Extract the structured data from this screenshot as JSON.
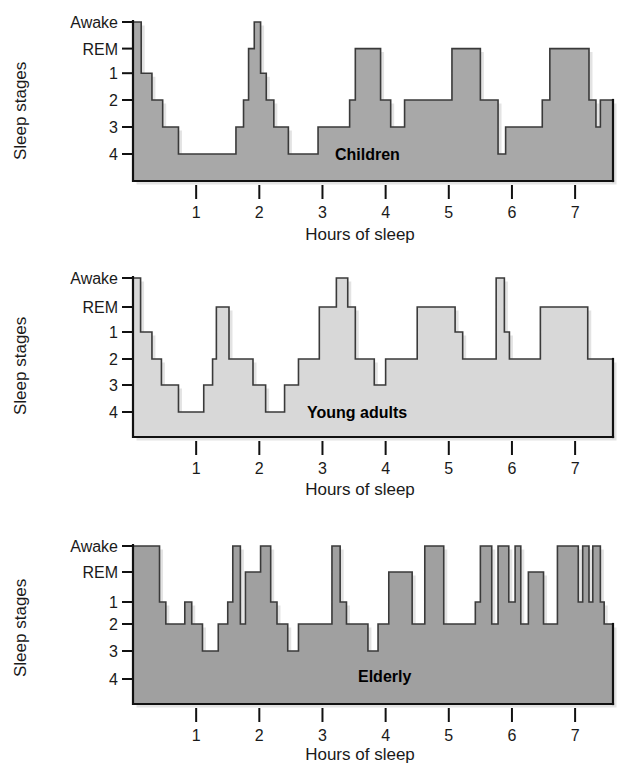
{
  "figure": {
    "title": "",
    "background_color": "#ffffff"
  },
  "axis_labels": {
    "y_title": "Sleep stages",
    "x_title": "Hours of sleep",
    "y_ticks": [
      "Awake",
      "REM",
      "1",
      "2",
      "3",
      "4"
    ],
    "x_ticks": [
      "1",
      "2",
      "3",
      "4",
      "5",
      "6",
      "7"
    ]
  },
  "panels": [
    {
      "label": "Children",
      "fill_color": "#a8a8a8",
      "stroke_color": "#3a3a3a"
    },
    {
      "label": "Young adults",
      "fill_color": "#d8d8d8",
      "stroke_color": "#555555"
    },
    {
      "label": "Elderly",
      "fill_color": "#a0a0a0",
      "stroke_color": "#2e2e2e"
    }
  ],
  "chart_data": [
    {
      "type": "area",
      "title": "Children",
      "xlabel": "Hours of sleep",
      "ylabel": "Sleep stages",
      "xlim": [
        0,
        7.6
      ],
      "ylim_categories": [
        "Awake",
        "REM",
        "1",
        "2",
        "3",
        "4"
      ],
      "y_numeric_map": {
        "Awake": 0,
        "REM": 1,
        "1": 2,
        "2": 3,
        "3": 4,
        "4": 5
      },
      "grid": false,
      "legend": "none",
      "fill_color": "#a8a8a8",
      "steps": [
        {
          "x_start": 0.0,
          "x_end": 0.13,
          "stage": "Awake"
        },
        {
          "x_start": 0.13,
          "x_end": 0.3,
          "stage": "1"
        },
        {
          "x_start": 0.3,
          "x_end": 0.47,
          "stage": "2"
        },
        {
          "x_start": 0.47,
          "x_end": 0.72,
          "stage": "3"
        },
        {
          "x_start": 0.72,
          "x_end": 1.63,
          "stage": "4"
        },
        {
          "x_start": 1.63,
          "x_end": 1.75,
          "stage": "3"
        },
        {
          "x_start": 1.75,
          "x_end": 1.83,
          "stage": "2"
        },
        {
          "x_start": 1.83,
          "x_end": 1.92,
          "stage": "REM"
        },
        {
          "x_start": 1.92,
          "x_end": 2.02,
          "stage": "Awake"
        },
        {
          "x_start": 2.02,
          "x_end": 2.11,
          "stage": "1"
        },
        {
          "x_start": 2.11,
          "x_end": 2.23,
          "stage": "2"
        },
        {
          "x_start": 2.23,
          "x_end": 2.46,
          "stage": "3"
        },
        {
          "x_start": 2.46,
          "x_end": 2.93,
          "stage": "4"
        },
        {
          "x_start": 2.93,
          "x_end": 3.43,
          "stage": "3"
        },
        {
          "x_start": 3.43,
          "x_end": 3.52,
          "stage": "2"
        },
        {
          "x_start": 3.52,
          "x_end": 3.92,
          "stage": "REM"
        },
        {
          "x_start": 3.92,
          "x_end": 4.08,
          "stage": "2"
        },
        {
          "x_start": 4.08,
          "x_end": 4.3,
          "stage": "3"
        },
        {
          "x_start": 4.3,
          "x_end": 5.05,
          "stage": "2"
        },
        {
          "x_start": 5.05,
          "x_end": 5.5,
          "stage": "REM"
        },
        {
          "x_start": 5.5,
          "x_end": 5.78,
          "stage": "2"
        },
        {
          "x_start": 5.78,
          "x_end": 5.9,
          "stage": "4"
        },
        {
          "x_start": 5.9,
          "x_end": 6.48,
          "stage": "3"
        },
        {
          "x_start": 6.48,
          "x_end": 6.6,
          "stage": "2"
        },
        {
          "x_start": 6.6,
          "x_end": 7.22,
          "stage": "REM"
        },
        {
          "x_start": 7.22,
          "x_end": 7.33,
          "stage": "2"
        },
        {
          "x_start": 7.33,
          "x_end": 7.4,
          "stage": "3"
        },
        {
          "x_start": 7.4,
          "x_end": 7.6,
          "stage": "2"
        }
      ]
    },
    {
      "type": "area",
      "title": "Young adults",
      "xlabel": "Hours of sleep",
      "ylabel": "Sleep stages",
      "xlim": [
        0,
        7.6
      ],
      "ylim_categories": [
        "Awake",
        "REM",
        "1",
        "2",
        "3",
        "4"
      ],
      "y_numeric_map": {
        "Awake": 0,
        "REM": 1,
        "1": 2,
        "2": 3,
        "3": 4,
        "4": 5
      },
      "grid": false,
      "legend": "none",
      "fill_color": "#d8d8d8",
      "steps": [
        {
          "x_start": 0.0,
          "x_end": 0.12,
          "stage": "Awake"
        },
        {
          "x_start": 0.12,
          "x_end": 0.3,
          "stage": "1"
        },
        {
          "x_start": 0.3,
          "x_end": 0.45,
          "stage": "2"
        },
        {
          "x_start": 0.45,
          "x_end": 0.72,
          "stage": "3"
        },
        {
          "x_start": 0.72,
          "x_end": 1.12,
          "stage": "4"
        },
        {
          "x_start": 1.12,
          "x_end": 1.26,
          "stage": "3"
        },
        {
          "x_start": 1.26,
          "x_end": 1.32,
          "stage": "2"
        },
        {
          "x_start": 1.32,
          "x_end": 1.52,
          "stage": "REM"
        },
        {
          "x_start": 1.52,
          "x_end": 1.9,
          "stage": "2"
        },
        {
          "x_start": 1.9,
          "x_end": 2.1,
          "stage": "3"
        },
        {
          "x_start": 2.1,
          "x_end": 2.4,
          "stage": "4"
        },
        {
          "x_start": 2.4,
          "x_end": 2.62,
          "stage": "3"
        },
        {
          "x_start": 2.62,
          "x_end": 2.95,
          "stage": "2"
        },
        {
          "x_start": 2.95,
          "x_end": 3.22,
          "stage": "REM"
        },
        {
          "x_start": 3.22,
          "x_end": 3.4,
          "stage": "Awake"
        },
        {
          "x_start": 3.4,
          "x_end": 3.52,
          "stage": "REM"
        },
        {
          "x_start": 3.52,
          "x_end": 3.82,
          "stage": "2"
        },
        {
          "x_start": 3.82,
          "x_end": 4.0,
          "stage": "3"
        },
        {
          "x_start": 4.0,
          "x_end": 4.5,
          "stage": "2"
        },
        {
          "x_start": 4.5,
          "x_end": 5.1,
          "stage": "REM"
        },
        {
          "x_start": 5.1,
          "x_end": 5.22,
          "stage": "1"
        },
        {
          "x_start": 5.22,
          "x_end": 5.75,
          "stage": "2"
        },
        {
          "x_start": 5.75,
          "x_end": 5.88,
          "stage": "Awake"
        },
        {
          "x_start": 5.88,
          "x_end": 5.96,
          "stage": "1"
        },
        {
          "x_start": 5.96,
          "x_end": 6.45,
          "stage": "2"
        },
        {
          "x_start": 6.45,
          "x_end": 7.2,
          "stage": "REM"
        },
        {
          "x_start": 7.2,
          "x_end": 7.6,
          "stage": "2"
        }
      ]
    },
    {
      "type": "area",
      "title": "Elderly",
      "xlabel": "Hours of sleep",
      "ylabel": "Sleep stages",
      "xlim": [
        0,
        7.6
      ],
      "ylim_categories": [
        "Awake",
        "REM",
        "1",
        "2",
        "3",
        "4"
      ],
      "y_numeric_map": {
        "Awake": 0,
        "REM": 1,
        "1": 2,
        "2": 3,
        "3": 4,
        "4": 5
      },
      "grid": false,
      "legend": "none",
      "fill_color": "#a0a0a0",
      "steps": [
        {
          "x_start": 0.0,
          "x_end": 0.42,
          "stage": "Awake"
        },
        {
          "x_start": 0.42,
          "x_end": 0.52,
          "stage": "1"
        },
        {
          "x_start": 0.52,
          "x_end": 0.82,
          "stage": "2"
        },
        {
          "x_start": 0.82,
          "x_end": 0.93,
          "stage": "1"
        },
        {
          "x_start": 0.93,
          "x_end": 1.1,
          "stage": "2"
        },
        {
          "x_start": 1.1,
          "x_end": 1.35,
          "stage": "3"
        },
        {
          "x_start": 1.35,
          "x_end": 1.5,
          "stage": "2"
        },
        {
          "x_start": 1.5,
          "x_end": 1.58,
          "stage": "1"
        },
        {
          "x_start": 1.58,
          "x_end": 1.7,
          "stage": "Awake"
        },
        {
          "x_start": 1.7,
          "x_end": 1.78,
          "stage": "2"
        },
        {
          "x_start": 1.78,
          "x_end": 2.02,
          "stage": "REM"
        },
        {
          "x_start": 2.02,
          "x_end": 2.18,
          "stage": "Awake"
        },
        {
          "x_start": 2.18,
          "x_end": 2.28,
          "stage": "1"
        },
        {
          "x_start": 2.28,
          "x_end": 2.45,
          "stage": "2"
        },
        {
          "x_start": 2.45,
          "x_end": 2.62,
          "stage": "3"
        },
        {
          "x_start": 2.62,
          "x_end": 3.15,
          "stage": "2"
        },
        {
          "x_start": 3.15,
          "x_end": 3.28,
          "stage": "Awake"
        },
        {
          "x_start": 3.28,
          "x_end": 3.38,
          "stage": "1"
        },
        {
          "x_start": 3.38,
          "x_end": 3.72,
          "stage": "2"
        },
        {
          "x_start": 3.72,
          "x_end": 3.88,
          "stage": "3"
        },
        {
          "x_start": 3.88,
          "x_end": 4.05,
          "stage": "2"
        },
        {
          "x_start": 4.05,
          "x_end": 4.42,
          "stage": "REM"
        },
        {
          "x_start": 4.42,
          "x_end": 4.62,
          "stage": "2"
        },
        {
          "x_start": 4.62,
          "x_end": 4.92,
          "stage": "Awake"
        },
        {
          "x_start": 4.92,
          "x_end": 5.42,
          "stage": "2"
        },
        {
          "x_start": 5.42,
          "x_end": 5.5,
          "stage": "1"
        },
        {
          "x_start": 5.5,
          "x_end": 5.68,
          "stage": "Awake"
        },
        {
          "x_start": 5.68,
          "x_end": 5.78,
          "stage": "2"
        },
        {
          "x_start": 5.78,
          "x_end": 5.95,
          "stage": "Awake"
        },
        {
          "x_start": 5.95,
          "x_end": 6.05,
          "stage": "1"
        },
        {
          "x_start": 6.05,
          "x_end": 6.14,
          "stage": "Awake"
        },
        {
          "x_start": 6.14,
          "x_end": 6.26,
          "stage": "2"
        },
        {
          "x_start": 6.26,
          "x_end": 6.5,
          "stage": "REM"
        },
        {
          "x_start": 6.5,
          "x_end": 6.72,
          "stage": "2"
        },
        {
          "x_start": 6.72,
          "x_end": 7.05,
          "stage": "Awake"
        },
        {
          "x_start": 7.05,
          "x_end": 7.12,
          "stage": "1"
        },
        {
          "x_start": 7.12,
          "x_end": 7.22,
          "stage": "Awake"
        },
        {
          "x_start": 7.22,
          "x_end": 7.28,
          "stage": "1"
        },
        {
          "x_start": 7.28,
          "x_end": 7.4,
          "stage": "Awake"
        },
        {
          "x_start": 7.4,
          "x_end": 7.46,
          "stage": "1"
        },
        {
          "x_start": 7.46,
          "x_end": 7.6,
          "stage": "2"
        }
      ]
    }
  ]
}
